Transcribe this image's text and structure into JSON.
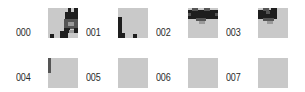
{
  "grid": {
    "tile_size": 30,
    "colors": {
      "background": "#ffffff",
      "tile": "#c9c9c9",
      "dark": "#1e1e1e",
      "mid": "#555555",
      "shade": "#9a9a9a"
    },
    "items": [
      {
        "label": "000",
        "label_pos": [
          16,
          28
        ],
        "tile_pos": [
          48,
          8
        ],
        "rects": [
          {
            "x": 20,
            "y": 0,
            "w": 3,
            "h": 5,
            "c": "dark"
          },
          {
            "x": 26,
            "y": 0,
            "w": 4,
            "h": 5,
            "c": "dark"
          },
          {
            "x": 17,
            "y": 4,
            "w": 13,
            "h": 8,
            "c": "dark"
          },
          {
            "x": 16,
            "y": 11,
            "w": 14,
            "h": 10,
            "c": "mid"
          },
          {
            "x": 20,
            "y": 14,
            "w": 6,
            "h": 4,
            "c": "shade"
          },
          {
            "x": 16,
            "y": 20,
            "w": 6,
            "h": 5,
            "c": "dark"
          },
          {
            "x": 26,
            "y": 20,
            "w": 4,
            "h": 5,
            "c": "dark"
          },
          {
            "x": 21,
            "y": 22,
            "w": 5,
            "h": 3,
            "c": "shade"
          },
          {
            "x": 12,
            "y": 23,
            "w": 8,
            "h": 7,
            "c": "dark"
          },
          {
            "x": 2,
            "y": 26,
            "w": 4,
            "h": 4,
            "c": "dark"
          }
        ]
      },
      {
        "label": "001",
        "label_pos": [
          86,
          28
        ],
        "tile_pos": [
          118,
          8
        ],
        "rects": [
          {
            "x": 0,
            "y": 9,
            "w": 4,
            "h": 21,
            "c": "dark"
          },
          {
            "x": 0,
            "y": 25,
            "w": 7,
            "h": 5,
            "c": "dark"
          },
          {
            "x": 15,
            "y": 26,
            "w": 4,
            "h": 4,
            "c": "dark"
          }
        ]
      },
      {
        "label": "002",
        "label_pos": [
          156,
          28
        ],
        "tile_pos": [
          188,
          8
        ],
        "rects": [
          {
            "x": 0,
            "y": 2,
            "w": 30,
            "h": 9,
            "c": "dark"
          },
          {
            "x": 4,
            "y": 0,
            "w": 6,
            "h": 3,
            "c": "mid"
          },
          {
            "x": 16,
            "y": 0,
            "w": 6,
            "h": 3,
            "c": "mid"
          },
          {
            "x": 0,
            "y": 5,
            "w": 3,
            "h": 3,
            "c": "mid"
          },
          {
            "x": 27,
            "y": 5,
            "w": 3,
            "h": 3,
            "c": "mid"
          },
          {
            "x": 8,
            "y": 10,
            "w": 10,
            "h": 3,
            "c": "mid"
          },
          {
            "x": 11,
            "y": 13,
            "w": 6,
            "h": 3,
            "c": "shade"
          }
        ]
      },
      {
        "label": "003",
        "label_pos": [
          226,
          28
        ],
        "tile_pos": [
          258,
          8
        ],
        "rects": [
          {
            "x": 0,
            "y": 2,
            "w": 19,
            "h": 9,
            "c": "dark"
          },
          {
            "x": 13,
            "y": 0,
            "w": 6,
            "h": 5,
            "c": "dark"
          },
          {
            "x": 5,
            "y": 0,
            "w": 6,
            "h": 3,
            "c": "mid"
          },
          {
            "x": 8,
            "y": 3,
            "w": 4,
            "h": 3,
            "c": "mid"
          },
          {
            "x": 5,
            "y": 10,
            "w": 11,
            "h": 3,
            "c": "mid"
          },
          {
            "x": 9,
            "y": 13,
            "w": 6,
            "h": 3,
            "c": "shade"
          }
        ]
      },
      {
        "label": "004",
        "label_pos": [
          16,
          73
        ],
        "tile_pos": [
          48,
          58
        ],
        "rects": [
          {
            "x": 0,
            "y": 0,
            "w": 3,
            "h": 15,
            "c": "mid"
          }
        ]
      },
      {
        "label": "005",
        "label_pos": [
          86,
          73
        ],
        "tile_pos": [
          118,
          58
        ],
        "rects": []
      },
      {
        "label": "006",
        "label_pos": [
          156,
          73
        ],
        "tile_pos": [
          188,
          58
        ],
        "rects": []
      },
      {
        "label": "007",
        "label_pos": [
          226,
          73
        ],
        "tile_pos": [
          258,
          58
        ],
        "rects": []
      }
    ]
  }
}
